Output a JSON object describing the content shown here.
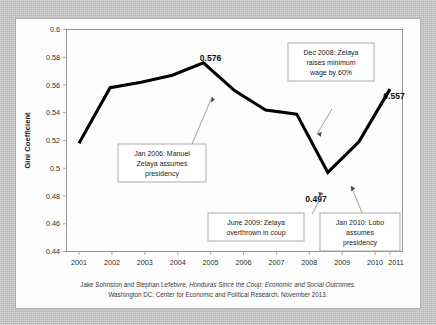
{
  "chart_data": {
    "type": "line",
    "title": "",
    "xlabel": "",
    "ylabel": "Gini Coefficient",
    "categories": [
      "2001",
      "2002",
      "2003",
      "2004",
      "2005",
      "2006",
      "2007",
      "2008",
      "2009",
      "2010",
      "2011"
    ],
    "values": [
      0.518,
      0.558,
      0.562,
      0.567,
      0.576,
      0.556,
      0.542,
      0.539,
      0.497,
      0.519,
      0.557
    ],
    "series": [
      {
        "name": "Gini Coefficient",
        "values": [
          0.518,
          0.558,
          0.562,
          0.567,
          0.576,
          0.556,
          0.542,
          0.539,
          0.497,
          0.519,
          0.557
        ]
      }
    ],
    "ylim": [
      0.44,
      0.6
    ],
    "ytick_step": 0.02,
    "ytick_labels": [
      "0.44",
      "0.46",
      "0.48",
      "0.5",
      "0.52",
      "0.54",
      "0.56",
      "0.58",
      "0.6"
    ],
    "grid": false,
    "legend": "none",
    "line_color": "#000000",
    "data_labels": [
      {
        "category": "2005",
        "value": "0.576"
      },
      {
        "category": "2009",
        "value": "0.497"
      },
      {
        "category": "2011",
        "value": "0.557"
      }
    ],
    "annotations": [
      {
        "id": "jan-2006",
        "lines": [
          "Jan 2006: Manuel",
          "Zelaya assumes",
          "presidency"
        ],
        "points_to": "2005"
      },
      {
        "id": "dec-2008",
        "lines": [
          "Dec 2008: Zelaya",
          "raises minimum",
          "wage by 60%"
        ],
        "points_to": "2008"
      },
      {
        "id": "june-2009",
        "lines": [
          "June 2009: Zelaya",
          "overthrown in coup"
        ],
        "points_to": "2009"
      },
      {
        "id": "jan-2010",
        "lines": [
          "Jan 2010: Lobo",
          "assumes",
          "presidency"
        ],
        "points_to": "2010"
      }
    ]
  },
  "axis": {
    "y_title": "Gini Coefficient",
    "y_ticks": [
      "0.6",
      "0.58",
      "0.56",
      "0.54",
      "0.52",
      "0.5",
      "0.48",
      "0.46",
      "0.44"
    ],
    "x_ticks": [
      "2001",
      "2002",
      "2003",
      "2004",
      "2005",
      "2006",
      "2007",
      "2008",
      "2009",
      "2010",
      "2011"
    ]
  },
  "labels": {
    "peak": "0.576",
    "trough": "0.497",
    "final": "0.557"
  },
  "annotations": {
    "a1_l1": "Jan 2006: Manuel",
    "a1_l2": "Zelaya assumes",
    "a1_l3": "presidency",
    "a2_l1": "Dec 2008: Zelaya",
    "a2_l2": "raises minimum",
    "a2_l3": "wage by 60%",
    "a3_l1": "June 2009: Zelaya",
    "a3_l2": "overthrown in coup",
    "a4_l1": "Jan 2010: Lobo",
    "a4_l2": "assumes",
    "a4_l3": "presidency"
  },
  "citation": {
    "line1_a": "Jake Sohnston and Stephan Lefebvre, ",
    "line1_italic": "Honduras Since the Coup: Economic and Social Outcomes",
    "line1_b": ".",
    "line2": "Washington DC: Center for Economic and Political Research, November 2013."
  }
}
